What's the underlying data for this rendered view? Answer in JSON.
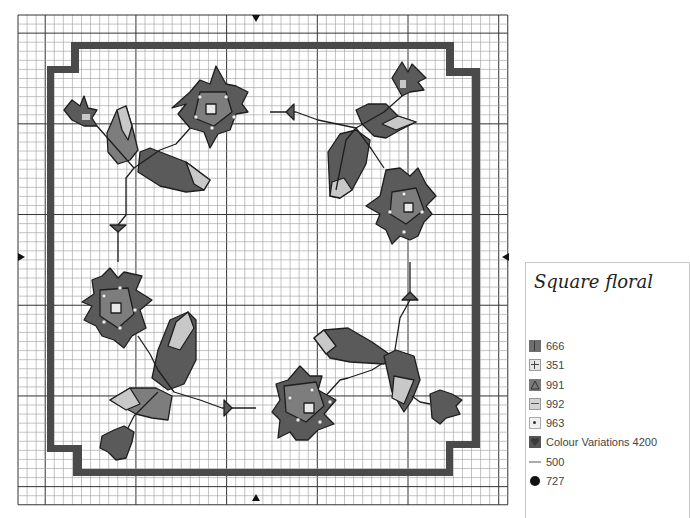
{
  "chart": {
    "title": "Square floral",
    "grid": {
      "x0": 18,
      "y0": 15,
      "cols": 54,
      "rows": 54,
      "cell": 9.07,
      "major_every": 10,
      "minor_color": "#9c9c9c",
      "major_color": "#333333"
    },
    "center_markers": [
      {
        "dir": "down",
        "x": 256,
        "y": 19
      },
      {
        "dir": "up",
        "x": 256,
        "y": 497
      },
      {
        "dir": "right",
        "x": 22,
        "y": 257
      },
      {
        "dir": "left",
        "x": 505,
        "y": 257
      }
    ],
    "frame_color": "#4a4a4a",
    "frame_path": "M71,42 L454,42 L454,68 L480,68 L480,448 L453,448 L453,476 L73,476 L73,452 L47,452 L47,66 L71,66 Z M79,49 L79,73 L54,73 L54,445 L82,445 L82,469 L446,469 L446,441 L472,441 L472,76 L446,76 L446,49 Z",
    "colors": {
      "dark": "#5a5a5a",
      "mid": "#7d7d7d",
      "light": "#c8c8c8",
      "outline": "#1e1e1e"
    }
  },
  "legend": {
    "title": "Square floral",
    "items": [
      {
        "code": "666",
        "label": "666",
        "symbol": "vertical-bar"
      },
      {
        "code": "351",
        "label": "351",
        "symbol": "plus"
      },
      {
        "code": "991",
        "label": "991",
        "symbol": "triangle"
      },
      {
        "code": "992",
        "label": "992",
        "symbol": "dash"
      },
      {
        "code": "963",
        "label": "963",
        "symbol": "dot-square"
      },
      {
        "code": "4200",
        "label": "Colour Variations 4200",
        "symbol": "heart-fill"
      },
      {
        "code": "500",
        "label": "500",
        "symbol": "backstitch-line"
      },
      {
        "code": "727",
        "label": "727",
        "symbol": "french-knot"
      }
    ]
  },
  "chart_data": {
    "type": "table",
    "title": "Square floral",
    "grid_size": [
      54,
      54
    ],
    "motifs": [
      "top-left flower with bud and leaves",
      "top-right flower with bud and leaves",
      "bottom-left flower with bud and leaves",
      "bottom-right flower with bud and leaves"
    ],
    "legend": [
      "666",
      "351",
      "991",
      "992",
      "963",
      "Colour Variations 4200",
      "500",
      "727"
    ]
  }
}
